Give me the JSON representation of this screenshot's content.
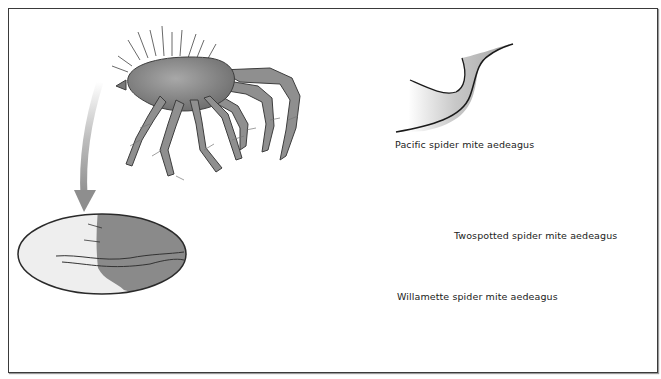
{
  "figure": {
    "frame": {
      "border_color": "#3a3a3a",
      "background": "#ffffff"
    },
    "mite_illustration": {
      "description": "spider mite, side view",
      "fill": "#8c8c8c",
      "outline": "#3d3d3d"
    },
    "magnified_view": {
      "description": "enlarged aedeagus inset (oval)",
      "fill": "#8a8a8a",
      "background": "#eeeeee"
    },
    "arrow": {
      "color": "#9a9a9a"
    },
    "aedeagus_panels": [
      {
        "id": "pacific",
        "label": "Pacific spider mite aedeagus"
      },
      {
        "id": "twospotted",
        "label": "Twospotted spider mite aedeagus"
      },
      {
        "id": "willamette",
        "label": "Willamette spider mite aedeagus"
      }
    ],
    "shape_fill": "#a8a8a8",
    "shape_outline": "#1a1a1a"
  }
}
